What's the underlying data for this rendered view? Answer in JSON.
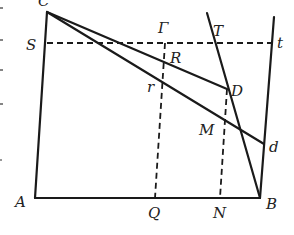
{
  "diagram": {
    "type": "geometric-construction",
    "labels": {
      "C": "C",
      "S": "S",
      "Gamma": "Γ",
      "T": "T",
      "t": "t",
      "R": "R",
      "r": "r",
      "D": "D",
      "M": "M",
      "d": "d",
      "A": "A",
      "Q": "Q",
      "N": "N",
      "B": "B"
    },
    "points": {
      "C": [
        47,
        12
      ],
      "A": [
        35,
        198
      ],
      "B": [
        260,
        198
      ],
      "S": [
        47,
        43
      ],
      "t": [
        271,
        43
      ],
      "Gamma": [
        165,
        43
      ],
      "T": [
        215,
        43
      ],
      "R": [
        165,
        58
      ],
      "r": [
        162,
        80
      ],
      "D": [
        227,
        89
      ],
      "M": [
        224,
        116
      ],
      "d": [
        264,
        144
      ],
      "Q": [
        155,
        198
      ],
      "N": [
        220,
        198
      ],
      "rightTop": [
        274,
        17
      ],
      "steepTop": [
        207,
        13
      ]
    },
    "solid_lines": [
      [
        "C",
        "A"
      ],
      [
        "A",
        "B"
      ],
      [
        "rightTop",
        "B"
      ],
      [
        "C",
        "D"
      ],
      [
        "C",
        "d"
      ],
      [
        "steepTop",
        "B"
      ]
    ],
    "dashed_lines": [
      [
        "S",
        "t"
      ],
      [
        "Gamma",
        "Q"
      ],
      [
        "D",
        "N"
      ]
    ],
    "colors": {
      "ink": "#1a1a1a",
      "background": "#ffffff"
    }
  }
}
